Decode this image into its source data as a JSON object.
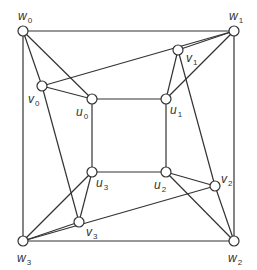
{
  "diagram": {
    "type": "graph",
    "title": "",
    "colors": {
      "stroke": "#333333",
      "node_fill": "#ffffff",
      "background": "#ffffff"
    },
    "nodes": [
      {
        "id": "w0",
        "base": "w",
        "sub": "0",
        "x": 23,
        "y": 31,
        "lx": 18,
        "ly": 20
      },
      {
        "id": "w1",
        "base": "w",
        "sub": "1",
        "x": 234,
        "y": 31,
        "lx": 229,
        "ly": 20
      },
      {
        "id": "w2",
        "base": "w",
        "sub": "2",
        "x": 234,
        "y": 241,
        "lx": 228,
        "ly": 262
      },
      {
        "id": "w3",
        "base": "w",
        "sub": "3",
        "x": 23,
        "y": 241,
        "lx": 17,
        "ly": 262
      },
      {
        "id": "v0",
        "base": "v",
        "sub": "0",
        "x": 42,
        "y": 86,
        "lx": 28,
        "ly": 103
      },
      {
        "id": "v1",
        "base": "v",
        "sub": "1",
        "x": 178,
        "y": 50,
        "lx": 186,
        "ly": 62
      },
      {
        "id": "v2",
        "base": "v",
        "sub": "2",
        "x": 215,
        "y": 186,
        "lx": 221,
        "ly": 183
      },
      {
        "id": "v3",
        "base": "v",
        "sub": "3",
        "x": 79,
        "y": 222,
        "lx": 86,
        "ly": 236
      },
      {
        "id": "u0",
        "base": "u",
        "sub": "0",
        "x": 92,
        "y": 99,
        "lx": 76,
        "ly": 116
      },
      {
        "id": "u1",
        "base": "u",
        "sub": "1",
        "x": 166,
        "y": 99,
        "lx": 170,
        "ly": 114
      },
      {
        "id": "u2",
        "base": "u",
        "sub": "2",
        "x": 166,
        "y": 172,
        "lx": 154,
        "ly": 189
      },
      {
        "id": "u3",
        "base": "u",
        "sub": "3",
        "x": 92,
        "y": 172,
        "lx": 96,
        "ly": 187
      }
    ],
    "edges": [
      [
        "w0",
        "w1"
      ],
      [
        "w1",
        "w2"
      ],
      [
        "w2",
        "w3"
      ],
      [
        "w3",
        "w0"
      ],
      [
        "u0",
        "u1"
      ],
      [
        "u1",
        "u2"
      ],
      [
        "u2",
        "u3"
      ],
      [
        "u3",
        "u0"
      ],
      [
        "w0",
        "v0"
      ],
      [
        "w0",
        "u0"
      ],
      [
        "v0",
        "u0"
      ],
      [
        "v0",
        "w1"
      ],
      [
        "v0",
        "v3"
      ],
      [
        "w1",
        "v1"
      ],
      [
        "w1",
        "u1"
      ],
      [
        "v1",
        "u1"
      ],
      [
        "v1",
        "v2"
      ],
      [
        "w2",
        "v2"
      ],
      [
        "w2",
        "u2"
      ],
      [
        "u2",
        "v2"
      ],
      [
        "v2",
        "w3"
      ],
      [
        "w3",
        "v3"
      ],
      [
        "w3",
        "u3"
      ],
      [
        "u3",
        "v3"
      ]
    ],
    "labels": {
      "w0": "w0",
      "w1": "w1",
      "w2": "w2",
      "w3": "w3",
      "v0": "v0",
      "v1": "v1",
      "v2": "v2",
      "v3": "v3",
      "u0": "u0",
      "u1": "u1",
      "u2": "u2",
      "u3": "u3"
    }
  }
}
